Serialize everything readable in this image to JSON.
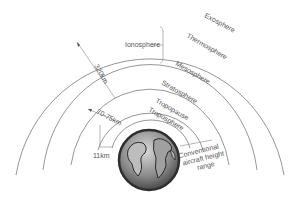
{
  "diagram": {
    "layers": [
      {
        "name": "Exosphere"
      },
      {
        "name": "Thermosphere"
      },
      {
        "name": "Mesosphere"
      },
      {
        "name": "Stratosphere"
      },
      {
        "name": "Tropopause"
      },
      {
        "name": "Troposphere"
      }
    ],
    "ionosphere_label": "Ionosphere",
    "dimensions": {
      "d1": "320km",
      "d2": "70-75km",
      "d3": "11km"
    },
    "aircraft_label": {
      "line1": "Conventional",
      "line2": "aircraft height",
      "line3": "range"
    },
    "colors": {
      "line": "#8a8a8a",
      "text": "#555555",
      "earth_dark": "#3a3a3a",
      "earth_light": "#a8a8a8"
    }
  }
}
